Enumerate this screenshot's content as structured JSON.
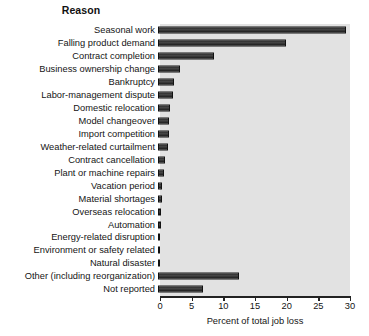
{
  "chart_data": {
    "type": "bar",
    "orientation": "horizontal",
    "title": "Reason",
    "xlabel": "Percent of total job loss",
    "ylabel": "",
    "xlim": [
      0,
      30
    ],
    "xticks": [
      0,
      5,
      10,
      15,
      20,
      25,
      30
    ],
    "grid": false,
    "legend": null,
    "plot_background": "#e2e2e2",
    "bar_color": "#2b2b2b",
    "categories": [
      "Seasonal work",
      "Falling product demand",
      "Contract completion",
      "Business ownership change",
      "Bankruptcy",
      "Labor-management dispute",
      "Domestic relocation",
      "Model changeover",
      "Import competition",
      "Weather-related curtailment",
      "Contract cancellation",
      "Plant or machine repairs",
      "Vacation period",
      "Material shortages",
      "Overseas relocation",
      "Automation",
      "Energy-related disruption",
      "Environment or safety related",
      "Natural disaster",
      "Other (including reorganization)",
      "Not reported"
    ],
    "values": [
      29.7,
      20.2,
      8.9,
      3.4,
      2.6,
      2.3,
      1.9,
      1.8,
      1.7,
      1.5,
      1.1,
      0.9,
      0.7,
      0.6,
      0.5,
      0.4,
      0.35,
      0.3,
      0.25,
      12.8,
      7.1
    ]
  }
}
